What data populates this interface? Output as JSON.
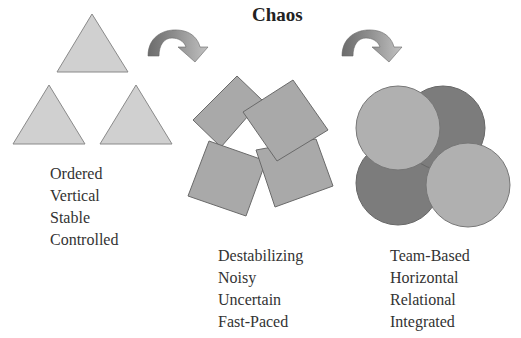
{
  "title": "Chaos",
  "colors": {
    "triangle_fill": "#d0d0d0",
    "triangle_stroke": "#8a8a8a",
    "square_fill": "#a9a9a9",
    "square_stroke": "#6a6a6a",
    "circle_light": "#b0b0b0",
    "circle_dark": "#7c7c7c",
    "arrow_dark": "#707070",
    "arrow_light": "#b8b8b8"
  },
  "stages": [
    {
      "shape": "triangles",
      "labels": [
        "Ordered",
        "Vertical",
        "Stable",
        "Controlled"
      ]
    },
    {
      "shape": "squares",
      "labels": [
        "Destabilizing",
        "Noisy",
        "Uncertain",
        "Fast-Paced"
      ]
    },
    {
      "shape": "circles",
      "labels": [
        "Team-Based",
        "Horizontal",
        "Relational",
        "Integrated"
      ]
    }
  ],
  "arrows": [
    {
      "from": "triangles",
      "to": "squares",
      "icon": "curved-arrow-right"
    },
    {
      "from": "squares",
      "to": "circles",
      "icon": "curved-arrow-right"
    }
  ]
}
